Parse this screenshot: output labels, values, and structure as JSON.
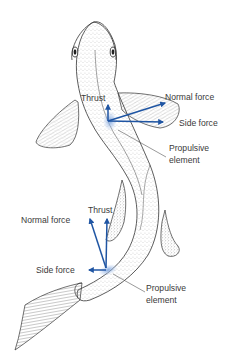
{
  "diagram": {
    "colors": {
      "arrow": "#1f55a3",
      "propulsive_highlight": "#8fb0e0",
      "outline": "#333333",
      "label_text": "#3a3a3a",
      "background": "#ffffff"
    },
    "upper_element": {
      "labels": {
        "thrust": "Thrust",
        "normal_force": "Normal force",
        "side_force": "Side force",
        "propulsive_line1": "Propulsive",
        "propulsive_line2": "element"
      }
    },
    "lower_element": {
      "labels": {
        "thrust": "Thrust",
        "normal_force": "Normal force",
        "side_force": "Side force",
        "propulsive_line1": "Propulsive",
        "propulsive_line2": "element"
      }
    }
  }
}
